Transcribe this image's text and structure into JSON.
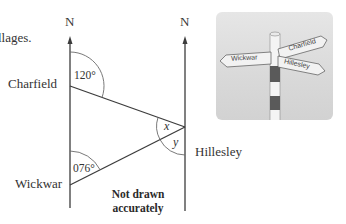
{
  "header": {
    "cut_text": "llages."
  },
  "diagram": {
    "north_labels": [
      "N",
      "N"
    ],
    "places": {
      "charfield": "Charfield",
      "wickwar": "Wickwar",
      "hillesley": "Hillesley"
    },
    "bearings": {
      "charfield_to_hillesley": "120°",
      "wickwar_to_hillesley": "076°"
    },
    "unknown_angles": {
      "x": "x",
      "y": "y"
    },
    "note_line1": "Not drawn",
    "note_line2": "accurately",
    "colors": {
      "line": "#3c3c3c",
      "arc": "#6a6a6a",
      "photo_bg": "#dcdcdc",
      "pole_dark": "#5a5a5a",
      "sign_fill": "#f2f2f2"
    }
  },
  "photo": {
    "sign_labels": {
      "left": "Wickwar",
      "upper_right": "Charfield",
      "lower_right": "Hillesley"
    }
  }
}
